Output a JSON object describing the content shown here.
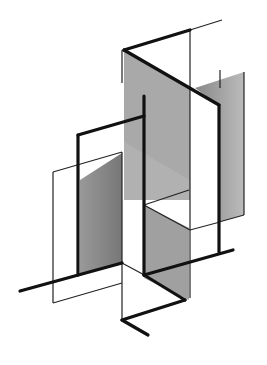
{
  "figure": {
    "colors": {
      "background": "#ffffff",
      "line": "#111111",
      "shade_dark": "#8a8a8a",
      "shade_light": "#b5b5b5"
    }
  }
}
